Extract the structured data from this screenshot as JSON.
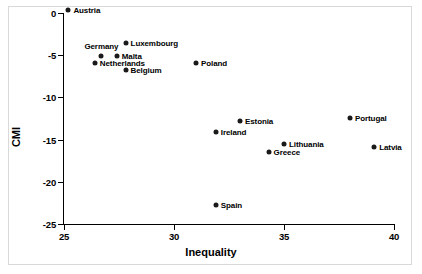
{
  "chart_data": {
    "type": "scatter",
    "title": "",
    "xlabel": "Inequality",
    "ylabel": "CMI",
    "xlim": [
      25,
      40
    ],
    "ylim": [
      -25,
      0
    ],
    "xticks": [
      "25",
      "30",
      "35",
      "40"
    ],
    "xtick_values": [
      25,
      30,
      35,
      40
    ],
    "yticks": [
      "0",
      "-5",
      "-10",
      "-15",
      "-20",
      "-25"
    ],
    "ytick_values": [
      0,
      -5,
      -10,
      -15,
      -20,
      -25
    ],
    "grid": false,
    "legend": "none",
    "marker_color": "#1a1a1a",
    "points": [
      {
        "label": "Austria",
        "x": 25.2,
        "y": 0.4,
        "label_pos": "right"
      },
      {
        "label": "Luxembourg",
        "x": 27.8,
        "y": -3.5,
        "label_pos": "right"
      },
      {
        "label": "Germany",
        "x": 26.7,
        "y": -5.1,
        "label_pos": "above"
      },
      {
        "label": "Malta",
        "x": 27.4,
        "y": -5.1,
        "label_pos": "right"
      },
      {
        "label": "Netherlands",
        "x": 26.4,
        "y": -5.9,
        "label_pos": "right"
      },
      {
        "label": "Belgium",
        "x": 27.8,
        "y": -6.7,
        "label_pos": "right"
      },
      {
        "label": "Poland",
        "x": 31.0,
        "y": -5.9,
        "label_pos": "right"
      },
      {
        "label": "Estonia",
        "x": 33.0,
        "y": -12.8,
        "label_pos": "right"
      },
      {
        "label": "Portugal",
        "x": 38.0,
        "y": -12.4,
        "label_pos": "right"
      },
      {
        "label": "Ireland",
        "x": 31.9,
        "y": -14.1,
        "label_pos": "right"
      },
      {
        "label": "Lithuania",
        "x": 35.0,
        "y": -15.5,
        "label_pos": "right"
      },
      {
        "label": "Latvia",
        "x": 39.1,
        "y": -15.9,
        "label_pos": "right"
      },
      {
        "label": "Greece",
        "x": 34.3,
        "y": -16.5,
        "label_pos": "right"
      },
      {
        "label": "Spain",
        "x": 31.9,
        "y": -22.7,
        "label_pos": "right"
      }
    ]
  }
}
